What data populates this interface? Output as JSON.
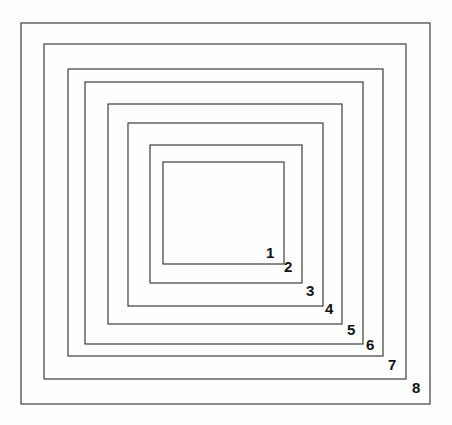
{
  "figure": {
    "canvas": {
      "width": 452,
      "height": 425,
      "background_color": "#fefefe"
    },
    "stroke_color": "#2b2b2b",
    "stroke_width": 1.1,
    "label_color": "#111111",
    "count": 8,
    "rects": [
      {
        "id": "rect-1",
        "label": "1",
        "x": 163.0,
        "y": 162.0,
        "width": 121.0,
        "height": 102.0,
        "label_x": 266.0,
        "label_y": 245.0
      },
      {
        "id": "rect-2",
        "label": "2",
        "x": 150.0,
        "y": 145.0,
        "width": 152.0,
        "height": 138.0,
        "label_x": 284.0,
        "label_y": 259.0
      },
      {
        "id": "rect-3",
        "label": "3",
        "x": 128.0,
        "y": 123.0,
        "width": 195.0,
        "height": 183.0,
        "label_x": 306.0,
        "label_y": 283.0
      },
      {
        "id": "rect-4",
        "label": "4",
        "x": 108.0,
        "y": 104.0,
        "width": 234.0,
        "height": 220.0,
        "label_x": 325.0,
        "label_y": 301.0
      },
      {
        "id": "rect-5",
        "label": "5",
        "x": 85.0,
        "y": 82.0,
        "width": 278.0,
        "height": 262.0,
        "label_x": 347.0,
        "label_y": 322.0
      },
      {
        "id": "rect-6",
        "label": "6",
        "x": 68.0,
        "y": 69.0,
        "width": 315.0,
        "height": 287.0,
        "label_x": 366.0,
        "label_y": 337.0
      },
      {
        "id": "rect-7",
        "label": "7",
        "x": 44.0,
        "y": 44.0,
        "width": 362.0,
        "height": 335.0,
        "label_x": 388.0,
        "label_y": 357.0
      },
      {
        "id": "rect-8",
        "label": "8",
        "x": 21.0,
        "y": 23.0,
        "width": 409.0,
        "height": 381.0,
        "label_x": 412.0,
        "label_y": 380.0
      }
    ]
  },
  "chart_data": {
    "type": "diagram",
    "categories": [
      "1",
      "2",
      "3",
      "4",
      "5",
      "6",
      "7",
      "8"
    ],
    "series": [
      {
        "name": "width",
        "values": [
          121,
          152,
          195,
          234,
          278,
          315,
          362,
          409
        ]
      },
      {
        "name": "height",
        "values": [
          102,
          138,
          183,
          220,
          262,
          287,
          335,
          381
        ]
      }
    ],
    "xlabel": "",
    "ylabel": "",
    "grid": false,
    "legend": false
  }
}
